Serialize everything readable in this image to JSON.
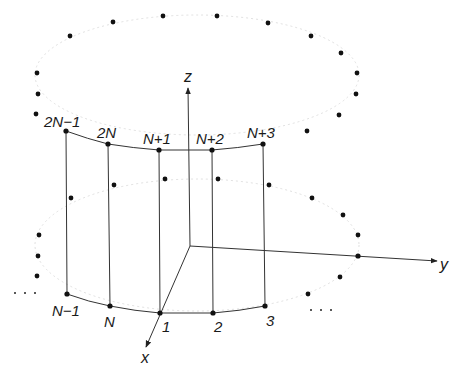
{
  "diagram": {
    "axes": {
      "x_label": "x",
      "y_label": "y",
      "z_label": "z"
    },
    "top_ring_labels": [
      "2N−1",
      "2N",
      "N+1",
      "N+2",
      "N+3"
    ],
    "bottom_ring_labels": [
      "N−1",
      "N",
      "1",
      "2",
      "3"
    ],
    "ellipsis": "· · ·",
    "colors": {
      "ink": "#1a1a1a",
      "background": "#ffffff"
    }
  }
}
